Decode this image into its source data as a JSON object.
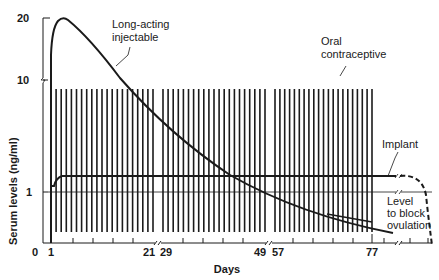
{
  "chart_data": {
    "type": "line",
    "title": "",
    "xlabel": "Days",
    "ylabel": "Serum levels (ng/ml)",
    "y_scale": "log",
    "y_ticks": [
      "20",
      "10",
      "1"
    ],
    "x_ticks": [
      "0",
      "1",
      "21",
      "29",
      "49",
      "57",
      "77"
    ],
    "colors": {
      "ink": "#1a1a1a",
      "background": "#ffffff"
    },
    "series": [
      {
        "name": "Long-acting injectable",
        "style": "solid",
        "points": [
          [
            1,
            8
          ],
          [
            2,
            17
          ],
          [
            4,
            20
          ],
          [
            6,
            19
          ],
          [
            14,
            13
          ],
          [
            21,
            10
          ],
          [
            29,
            7
          ],
          [
            40,
            4
          ],
          [
            49,
            2.6
          ],
          [
            57,
            1.8
          ],
          [
            70,
            0.9
          ],
          [
            77,
            0.55
          ],
          [
            82,
            0.45
          ]
        ]
      },
      {
        "name": "Oral contraceptive",
        "style": "pulsed",
        "cycles": [
          [
            1,
            21
          ],
          [
            29,
            49
          ],
          [
            57,
            77
          ]
        ],
        "peak": 8,
        "trough": 0.35
      },
      {
        "name": "Implant",
        "style": "solid-then-dashed",
        "points": [
          [
            1,
            1.2
          ],
          [
            4,
            1.45
          ],
          [
            84,
            1.45
          ]
        ],
        "dashed_tail": [
          [
            84,
            1.45
          ],
          [
            90,
            1.4
          ],
          [
            94,
            1.0
          ],
          [
            96,
            0.3
          ]
        ]
      },
      {
        "name": "Level to block ovulation",
        "style": "reference-line",
        "value": 1
      }
    ],
    "annotations": [
      {
        "text": [
          "Long-acting",
          "injectable"
        ],
        "target": "Long-acting injectable"
      },
      {
        "text": [
          "Oral",
          "contraceptive"
        ],
        "target": "Oral contraceptive"
      },
      {
        "text": [
          "Implant"
        ],
        "target": "Implant"
      },
      {
        "text": [
          "Level",
          "to block",
          "ovulation"
        ],
        "target": "Level to block ovulation"
      }
    ]
  },
  "labels": {
    "injectable_1": "Long-acting",
    "injectable_2": "injectable",
    "oral_1": "Oral",
    "oral_2": "contraceptive",
    "implant": "Implant",
    "level_1": "Level",
    "level_2": "to block",
    "level_3": "ovulation",
    "xlabel": "Days",
    "ylabel": "Serum levels (ng/ml)",
    "y20": "20",
    "y10": "10",
    "y1": "1",
    "x0": "0",
    "x1": "1",
    "x21": "21",
    "x29": "29",
    "x49": "49",
    "x57": "57",
    "x77": "77"
  }
}
